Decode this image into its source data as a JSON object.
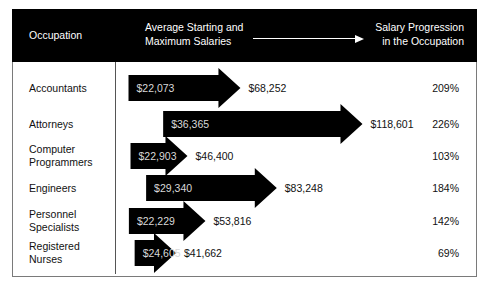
{
  "header": {
    "occupation": "Occupation",
    "salaries_line1": "Average Starting and",
    "salaries_line2": "Maximum Salaries",
    "progression_line1": "Salary Progression",
    "progression_line2": "in the Occupation"
  },
  "colors": {
    "header_bg": "#000000",
    "arrow": "#000000",
    "start_text": "#d8d8d8"
  },
  "rows": [
    {
      "occupation_line1": "Accountants",
      "occupation_line2": "",
      "start": "$22,073",
      "max": "$68,252",
      "progression": "209%"
    },
    {
      "occupation_line1": "Attorneys",
      "occupation_line2": "",
      "start": "$36,365",
      "max": "$118,601",
      "progression": "226%"
    },
    {
      "occupation_line1": "Computer",
      "occupation_line2": "Programmers",
      "start": "$22,903",
      "max": "$46,400",
      "progression": "103%"
    },
    {
      "occupation_line1": "Engineers",
      "occupation_line2": "",
      "start": "$29,340",
      "max": "$83,248",
      "progression": "184%"
    },
    {
      "occupation_line1": "Personnel",
      "occupation_line2": "Specialists",
      "start": "$22,229",
      "max": "$53,816",
      "progression": "142%"
    },
    {
      "occupation_line1": "Registered",
      "occupation_line2": "Nurses",
      "start": "$24,605",
      "max": "$41,662",
      "progression": "69%"
    }
  ],
  "chart_data": {
    "type": "table",
    "title": "",
    "columns": [
      "Occupation",
      "Average Starting Salary",
      "Average Maximum Salary",
      "Salary Progression in the Occupation"
    ],
    "categories": [
      "Accountants",
      "Attorneys",
      "Computer Programmers",
      "Engineers",
      "Personnel Specialists",
      "Registered Nurses"
    ],
    "series": [
      {
        "name": "Average Starting Salary",
        "values": [
          22073,
          36365,
          22903,
          29340,
          22229,
          24605
        ]
      },
      {
        "name": "Average Maximum Salary",
        "values": [
          68252,
          118601,
          46400,
          83248,
          53816,
          41662
        ]
      },
      {
        "name": "Salary Progression (%)",
        "values": [
          209,
          226,
          103,
          184,
          142,
          69
        ]
      }
    ],
    "encoding": "Arrows span from starting salary (left edge) to maximum salary (arrow tip)"
  }
}
